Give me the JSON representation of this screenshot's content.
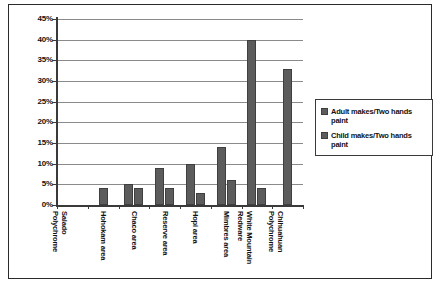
{
  "chart_data": {
    "type": "bar",
    "title": "",
    "xlabel": "",
    "ylabel": "",
    "ylim": [
      0,
      45
    ],
    "ytick_step": 5,
    "grid": true,
    "legend_position": "right",
    "categories": [
      "Salado Polychrome",
      "Hohokam area",
      "Chaco area",
      "Reserve area",
      "Hopi area",
      "Mimbres area",
      "White Mountain Redware",
      "Chihuahuan Polychrome"
    ],
    "ytick_labels": [
      "45%",
      "40%",
      "35%",
      "30%",
      "25%",
      "20%",
      "15%",
      "10%",
      "5%",
      "0%"
    ],
    "series": [
      {
        "name": "Adult makes/Two hands paint",
        "color": "#5c5c5c",
        "values": [
          0,
          4,
          5,
          9,
          10,
          14,
          40,
          33
        ]
      },
      {
        "name": "Child makes/Two hands paint",
        "color": "#5c5c5c",
        "values": [
          0,
          0,
          4,
          4,
          3,
          6,
          4,
          0
        ]
      }
    ]
  },
  "legend": {
    "items": [
      {
        "label": "Adult makes/Two hands paint",
        "swatch": "legend-swatch-adult"
      },
      {
        "label": "Child makes/Two hands paint",
        "swatch": "legend-swatch-child"
      }
    ]
  },
  "axis": {
    "y_labels": [
      "45%",
      "40%",
      "35%",
      "30%",
      "25%",
      "20%",
      "15%",
      "10%",
      "5%",
      "0%"
    ],
    "x_labels": [
      "Salado Polychrome",
      "Hohokam area",
      "Chaco area",
      "Reserve area",
      "Hopi area",
      "Mimbres area",
      "White Mountain Redware",
      "Chihuahuan Polychrome"
    ]
  }
}
